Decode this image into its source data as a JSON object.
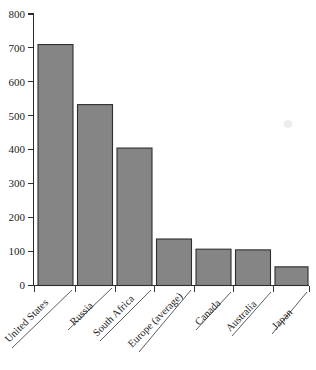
{
  "chart_data": {
    "type": "bar",
    "title": "",
    "subtitle": "",
    "xlabel": "",
    "ylabel": "",
    "ylim": [
      0,
      800
    ],
    "ytick_step": 100,
    "ytick_labels": [
      "0",
      "100",
      "200",
      "300",
      "400",
      "500",
      "600",
      "700",
      "800"
    ],
    "grid": false,
    "legend": false,
    "legend_position": "none",
    "categories": [
      "United States",
      "Russia",
      "South Africa",
      "Europe (average)",
      "Canada",
      "Australia",
      "Japan"
    ],
    "values": [
      710,
      533,
      405,
      137,
      107,
      105,
      55
    ],
    "bar_fill_color": "#858585",
    "bar_edge_color": "#2e2e2e",
    "axis_color": "#2b2b2b",
    "background_color": "#ffffff",
    "xtick_label_rotation": 45
  },
  "axis": {
    "y_ticks": [
      {
        "label": "800",
        "value": 800
      },
      {
        "label": "700",
        "value": 700
      },
      {
        "label": "600",
        "value": 600
      },
      {
        "label": "500",
        "value": 500
      },
      {
        "label": "400",
        "value": 400
      },
      {
        "label": "300",
        "value": 300
      },
      {
        "label": "200",
        "value": 200
      },
      {
        "label": "100",
        "value": 100
      },
      {
        "label": "0",
        "value": 0
      }
    ]
  },
  "bars": [
    {
      "label": "United States",
      "value": 710
    },
    {
      "label": "Russia",
      "value": 533
    },
    {
      "label": "South Africa",
      "value": 405
    },
    {
      "label": "Europe (average)",
      "value": 137
    },
    {
      "label": "Canada",
      "value": 107
    },
    {
      "label": "Australia",
      "value": 105
    },
    {
      "label": "Japan",
      "value": 55
    }
  ]
}
